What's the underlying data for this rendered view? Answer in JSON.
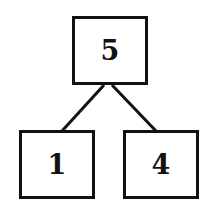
{
  "diagram": {
    "type": "number-bond",
    "root": {
      "value": "5"
    },
    "children": [
      {
        "value": "1"
      },
      {
        "value": "4"
      }
    ],
    "colors": {
      "stroke": "#111111",
      "background": "#ffffff"
    }
  }
}
